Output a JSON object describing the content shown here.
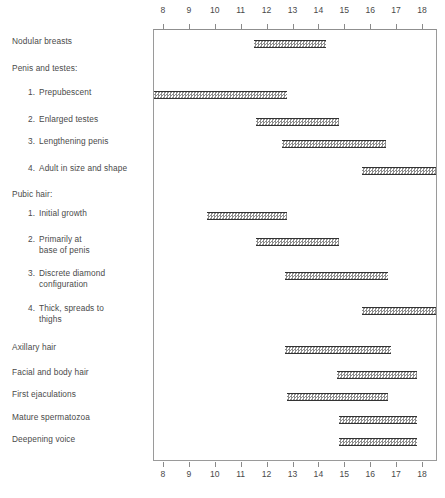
{
  "chart_data": {
    "type": "bar",
    "orientation": "horizontal-range",
    "title": "",
    "subtitle": "",
    "xlabel": "",
    "ylabel": "",
    "xlim": [
      7.65,
      18.6
    ],
    "grid": false,
    "legend": null,
    "axis_ticks": [
      8,
      9,
      10,
      11,
      12,
      13,
      14,
      15,
      16,
      17,
      18
    ],
    "axis_tick_labels": [
      "8",
      "9",
      "10",
      "11",
      "12",
      "13",
      "14",
      "15",
      "16",
      "17",
      "18"
    ],
    "axis_positions": [
      "top",
      "bottom"
    ],
    "categories": [
      "Nodular breasts",
      "Penis and testes:",
      "1.  Prepubescent",
      "2.  Enlarged testes",
      "3.  Lengthening penis",
      "4.  Adult in size and shape",
      "Pubic hair:",
      "1.  Initial growth",
      "2.  Primarily at base of penis",
      "3.  Discrete diamond configuration",
      "4.  Thick, spreads to thighs",
      "Axillary hair",
      "Facial and body hair",
      "First ejaculations",
      "Mature spermatozoa",
      "Deepening voice"
    ],
    "rows": [
      {
        "label": "Nodular breasts",
        "kind": "item",
        "number": "",
        "text": "Nodular breasts",
        "start": 11.5,
        "end": 14.3,
        "has_bar": true
      },
      {
        "label": "Penis and testes:",
        "kind": "heading",
        "number": "",
        "text": "Penis and testes:",
        "start": null,
        "end": null,
        "has_bar": false
      },
      {
        "label": "1. Prepubescent",
        "kind": "sub",
        "number": "1.",
        "text": "Prepubescent",
        "start": 7.65,
        "end": 12.8,
        "has_bar": true
      },
      {
        "label": "2. Enlarged testes",
        "kind": "sub",
        "number": "2.",
        "text": "Enlarged testes",
        "start": 11.6,
        "end": 14.8,
        "has_bar": true
      },
      {
        "label": "3. Lengthening penis",
        "kind": "sub",
        "number": "3.",
        "text": "Lengthening penis",
        "start": 12.6,
        "end": 16.6,
        "has_bar": true
      },
      {
        "label": "4. Adult in size and shape",
        "kind": "sub",
        "number": "4.",
        "text": "Adult in size and shape",
        "start": 15.7,
        "end": 18.6,
        "has_bar": true
      },
      {
        "label": "Pubic hair:",
        "kind": "heading",
        "number": "",
        "text": "Pubic hair:",
        "start": null,
        "end": null,
        "has_bar": false
      },
      {
        "label": "1. Initial growth",
        "kind": "sub",
        "number": "1.",
        "text": "Initial growth",
        "start": 9.7,
        "end": 12.8,
        "has_bar": true
      },
      {
        "label": "2. Primarily at base",
        "kind": "sub",
        "number": "2.",
        "text": "Primarily at\nbase of penis",
        "start": 11.6,
        "end": 14.8,
        "has_bar": true
      },
      {
        "label": "3. Discrete diamond",
        "kind": "sub",
        "number": "3.",
        "text": "Discrete diamond\nconfiguration",
        "start": 12.7,
        "end": 16.7,
        "has_bar": true
      },
      {
        "label": "4. Thick, spreads to thighs",
        "kind": "sub",
        "number": "4.",
        "text": "Thick, spreads to\nthighs",
        "start": 15.7,
        "end": 18.6,
        "has_bar": true
      },
      {
        "label": "Axillary hair",
        "kind": "item",
        "number": "",
        "text": "Axillary hair",
        "start": 12.7,
        "end": 16.8,
        "has_bar": true
      },
      {
        "label": "Facial and body hair",
        "kind": "item",
        "number": "",
        "text": "Facial and body hair",
        "start": 14.7,
        "end": 17.8,
        "has_bar": true
      },
      {
        "label": "First ejaculations",
        "kind": "item",
        "number": "",
        "text": "First ejaculations",
        "start": 12.8,
        "end": 16.7,
        "has_bar": true
      },
      {
        "label": "Mature spermatozoa",
        "kind": "item",
        "number": "",
        "text": "Mature spermatozoa",
        "start": 14.8,
        "end": 17.8,
        "has_bar": true
      },
      {
        "label": "Deepening voice",
        "kind": "item",
        "number": "",
        "text": "Deepening voice",
        "start": 14.8,
        "end": 17.8,
        "has_bar": true
      }
    ],
    "colors": {
      "bar_border": "#333333",
      "bar_fill": "#8d8d8d",
      "frame": "#9a9a9a",
      "text": "#4a4a4a",
      "background": "#ffffff"
    }
  }
}
